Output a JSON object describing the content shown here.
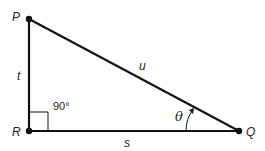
{
  "diagram": {
    "type": "right-triangle",
    "vertices": {
      "P": {
        "label": "P"
      },
      "R": {
        "label": "R"
      },
      "Q": {
        "label": "Q"
      }
    },
    "sides": {
      "PR": {
        "label": "t"
      },
      "RQ": {
        "label": "s"
      },
      "PQ": {
        "label": "u"
      }
    },
    "angles": {
      "right_angle": {
        "label": "90°",
        "vertex": "R"
      },
      "theta": {
        "label": "θ",
        "vertex": "Q"
      }
    },
    "colors": {
      "stroke": "#111111",
      "text": "#222222",
      "background": "#ffffff"
    }
  }
}
